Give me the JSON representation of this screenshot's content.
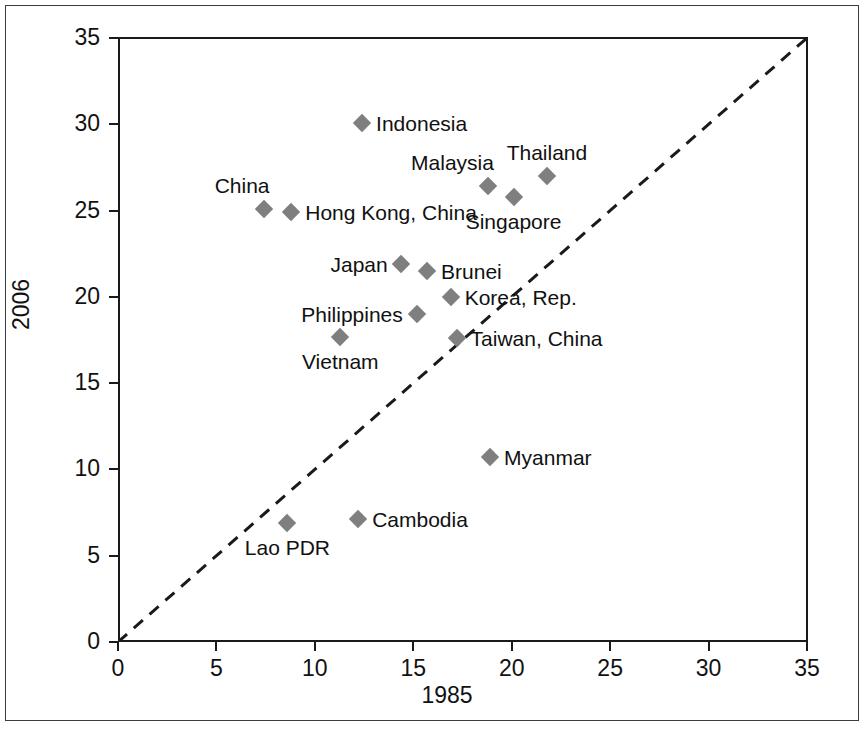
{
  "chart_data": {
    "type": "scatter",
    "title": "",
    "xlabel": "1985",
    "ylabel": "2006",
    "xlim": [
      0,
      35
    ],
    "ylim": [
      0,
      35
    ],
    "xticks": [
      "0",
      "5",
      "10",
      "15",
      "20",
      "25",
      "30",
      "35"
    ],
    "yticks": [
      "0",
      "5",
      "10",
      "15",
      "20",
      "25",
      "30",
      "35"
    ],
    "grid": false,
    "legend": "none",
    "annotations": [
      {
        "name": "diagonal-45-degree-reference-line",
        "style": "dashed",
        "from": [
          0,
          0
        ],
        "to": [
          35,
          35
        ]
      }
    ],
    "points": [
      {
        "label": "Indonesia",
        "x": 12.4,
        "y": 30.1,
        "label_pos": "right"
      },
      {
        "label": "Thailand",
        "x": 21.8,
        "y": 27.0,
        "label_pos": "above"
      },
      {
        "label": "Malaysia",
        "x": 18.8,
        "y": 26.4,
        "label_pos": "above-left"
      },
      {
        "label": "Singapore",
        "x": 20.1,
        "y": 25.8,
        "label_pos": "below"
      },
      {
        "label": "China",
        "x": 7.4,
        "y": 25.1,
        "label_pos": "above-left"
      },
      {
        "label": "Hong Kong, China",
        "x": 8.8,
        "y": 24.9,
        "label_pos": "right"
      },
      {
        "label": "Japan",
        "x": 14.4,
        "y": 21.9,
        "label_pos": "left"
      },
      {
        "label": "Brunei",
        "x": 15.7,
        "y": 21.5,
        "label_pos": "right"
      },
      {
        "label": "Korea, Rep.",
        "x": 16.9,
        "y": 20.0,
        "label_pos": "right"
      },
      {
        "label": "Philippines",
        "x": 15.2,
        "y": 19.0,
        "label_pos": "left"
      },
      {
        "label": "Vietnam",
        "x": 11.3,
        "y": 17.7,
        "label_pos": "below"
      },
      {
        "label": "Taiwan, China",
        "x": 17.2,
        "y": 17.6,
        "label_pos": "right"
      },
      {
        "label": "Myanmar",
        "x": 18.9,
        "y": 10.7,
        "label_pos": "right"
      },
      {
        "label": "Cambodia",
        "x": 12.2,
        "y": 7.1,
        "label_pos": "right"
      },
      {
        "label": "Lao PDR",
        "x": 8.6,
        "y": 6.9,
        "label_pos": "below"
      }
    ]
  },
  "axes": {
    "x": {
      "label": "1985",
      "tick_labels": [
        "0",
        "5",
        "10",
        "15",
        "20",
        "25",
        "30",
        "35"
      ]
    },
    "y": {
      "label": "2006",
      "tick_labels": [
        "0",
        "5",
        "10",
        "15",
        "20",
        "25",
        "30",
        "35"
      ]
    }
  },
  "colors": {
    "marker": "#7f7f7f",
    "axis": "#1a1a1a",
    "text": "#111111",
    "frame": "#3b3b44",
    "background": "#ffffff"
  }
}
